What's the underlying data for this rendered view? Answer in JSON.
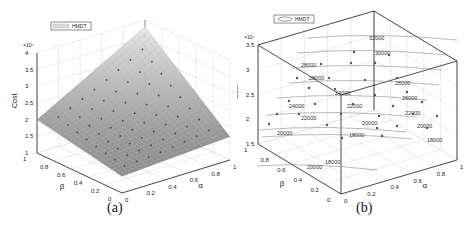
{
  "figure": {
    "panels": [
      {
        "id": "a",
        "caption": "(a)"
      },
      {
        "id": "b",
        "caption": "(b)"
      }
    ]
  },
  "chart_data": [
    {
      "type": "surface",
      "panel": "(a)",
      "title": "",
      "legend": [
        "HMDT"
      ],
      "legend_position": "top-left",
      "xlabel": "α",
      "ylabel": "β",
      "zlabel": "Cost",
      "z_exponent": "×10^4",
      "x_ticks": [
        "0",
        "0.2",
        "0.4",
        "0.6",
        "0.8",
        "1"
      ],
      "y_ticks": [
        "0",
        "0.2",
        "0.4",
        "0.6",
        "0.8",
        "1"
      ],
      "z_ticks": [
        "1",
        "1.5",
        "2",
        "2.5",
        "3",
        "3.5",
        "4"
      ],
      "xlim": [
        0,
        1
      ],
      "ylim": [
        0,
        1
      ],
      "zlim": [
        10000,
        40000
      ],
      "grid": true,
      "surface_corner_values": {
        "alpha0_beta0": 15000,
        "alpha1_beta0": 17000,
        "alpha0_beta1": 20000,
        "alpha1_beta1": 38000,
        "minimum_approx": 14000
      },
      "markers": "grid of sample points (dots) on surface"
    },
    {
      "type": "contour3d",
      "panel": "(b)",
      "title": "",
      "legend": [
        "HMDT"
      ],
      "legend_position": "top-left",
      "xlabel": "α",
      "ylabel": "β",
      "zlabel": "Cost",
      "z_exponent": "×10^4",
      "x_ticks": [
        "0",
        "0.2",
        "0.4",
        "0.6",
        "0.8",
        "1"
      ],
      "y_ticks": [
        "0",
        "0.2",
        "0.4",
        "0.6",
        "0.8",
        "1"
      ],
      "z_ticks": [
        "1.5",
        "2",
        "2.5",
        "3",
        "3.5"
      ],
      "xlim": [
        0,
        1
      ],
      "ylim": [
        0,
        1
      ],
      "zlim": [
        15000,
        35000
      ],
      "grid": true,
      "contour_levels": [
        16000,
        18000,
        20000,
        22000,
        24000,
        26000,
        28000,
        30000,
        32000
      ],
      "contour_labels": [
        "32000",
        "30000",
        "28000",
        "28000",
        "26000",
        "24000",
        "26000",
        "24000",
        "22000",
        "22000",
        "22000",
        "20000",
        "20000",
        "20000",
        "18000",
        "18000",
        "18000",
        "20000",
        "18000"
      ],
      "markers": "grid of sample points (dots)"
    }
  ]
}
